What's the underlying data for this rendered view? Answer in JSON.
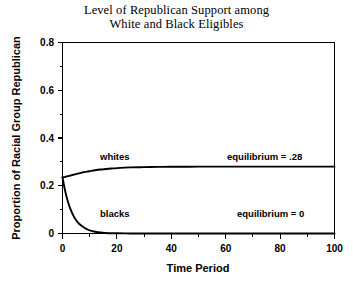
{
  "chart_data": {
    "type": "line",
    "title": "Level of Republican Support among White and Black Eligibles",
    "title_lines": [
      "Level of Republican Support among",
      "White and Black Eligibles"
    ],
    "xlabel": "Time Period",
    "ylabel": "Proportion of Racial Group Republican",
    "xlim": [
      0,
      100
    ],
    "ylim": [
      0,
      0.8
    ],
    "grid": false,
    "legend": "inline-labels",
    "x_ticks": [
      0,
      20,
      40,
      60,
      80,
      100
    ],
    "x_tick_labels": [
      "0",
      "20",
      "40",
      "60",
      "80",
      "100"
    ],
    "x_minor_ticks": [
      10,
      30,
      50,
      70,
      90
    ],
    "y_ticks": [
      0,
      0.2,
      0.4,
      0.6,
      0.8
    ],
    "y_tick_labels": [
      "0",
      "0.2",
      "0.4",
      "0.6",
      "0.8"
    ],
    "y_minor_ticks": [
      0.1,
      0.3,
      0.5,
      0.7
    ],
    "x": [
      0,
      1,
      2,
      3,
      4,
      5,
      6,
      7,
      8,
      9,
      10,
      12,
      14,
      16,
      18,
      20,
      25,
      30,
      35,
      40,
      50,
      60,
      70,
      80,
      90,
      100
    ],
    "series": [
      {
        "name": "whites",
        "label": "whites",
        "values": [
          0.235,
          0.237,
          0.24,
          0.243,
          0.246,
          0.249,
          0.252,
          0.255,
          0.257,
          0.259,
          0.261,
          0.265,
          0.268,
          0.27,
          0.272,
          0.274,
          0.277,
          0.278,
          0.279,
          0.2795,
          0.28,
          0.28,
          0.28,
          0.28,
          0.28,
          0.28
        ],
        "equilibrium": 0.28,
        "equilibrium_label": "equilibrium = .28"
      },
      {
        "name": "blacks",
        "label": "blacks",
        "values": [
          0.235,
          0.177,
          0.133,
          0.1,
          0.075,
          0.056,
          0.042,
          0.032,
          0.024,
          0.018,
          0.013,
          0.0075,
          0.0042,
          0.0024,
          0.0013,
          0.0008,
          0.0002,
          0.0,
          0.0,
          0.0,
          0.0,
          0.0,
          0.0,
          0.0,
          0.0,
          0.0
        ],
        "equilibrium": 0,
        "equilibrium_label": "equilibrium = 0"
      }
    ],
    "annotations": [
      {
        "text": "whites",
        "x": 14,
        "y": 0.325
      },
      {
        "text": "blacks",
        "x": 14,
        "y": 0.085
      },
      {
        "text": "equilibrium = .28",
        "x": 66,
        "y": 0.325
      },
      {
        "text": "equilibrium = 0",
        "x": 66,
        "y": 0.085
      }
    ],
    "colors": {
      "curve": "#000000",
      "axis": "#000000",
      "background": "#ffffff",
      "text": "#000000"
    }
  }
}
